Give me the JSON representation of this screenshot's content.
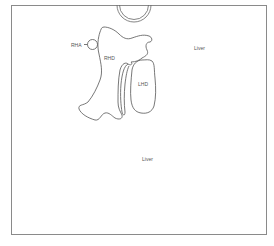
{
  "diagram": {
    "type": "anatomical-schematic",
    "frame_color": "#8a8a8a",
    "stroke_color": "#555555",
    "labels": {
      "rha": "RHA",
      "rhd": "RHD",
      "lhd": "LHD",
      "liver_upper_right": "Liver",
      "liver_center": "Liver"
    },
    "structures": [
      {
        "id": "top-vessel",
        "shape": "double-semicircle"
      },
      {
        "id": "rha",
        "shape": "small-circle",
        "label": "RHA"
      },
      {
        "id": "rhd",
        "shape": "irregular-outline",
        "label": "RHD"
      },
      {
        "id": "lhd",
        "shape": "irregular-outline",
        "label": "LHD"
      }
    ]
  }
}
